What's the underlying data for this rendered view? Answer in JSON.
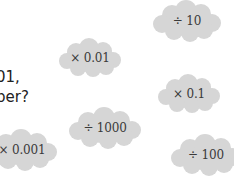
{
  "question": {
    "line1": "01,",
    "line2": "ber?"
  },
  "cloud_color": "#d6d6d6",
  "text_color": "#3a3a3a",
  "clouds": [
    {
      "label": "÷ 10"
    },
    {
      "label": "× 0.01"
    },
    {
      "label": "× 0.1"
    },
    {
      "label": "÷ 1000"
    },
    {
      "label": "× 0.001"
    },
    {
      "label": "÷ 100"
    }
  ]
}
